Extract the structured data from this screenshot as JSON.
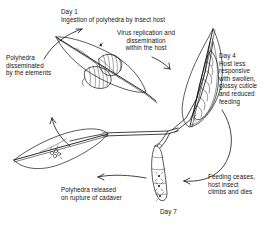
{
  "diagram": {
    "background_color": "#ffffff",
    "line_color": "#141414",
    "captions": {
      "day1": "Day 1\nIngestion of polyhedra by insect host",
      "virus_replication": "Virus replication and\ndissemination\nwithin the host",
      "day4": "Day 4\nHost less\nresponsive\nwith swollen,\nglossy cuticle\nand reduced\nfeeding",
      "dissemination": "Polyhedra\ndisseminated\nby the elements",
      "feeding_ceases": "Feeding ceases,\nhost insect\nclimbs and dies",
      "polyhedra_released": "Polyhedra released\non rupture of cadaver",
      "day7": "Day 7"
    },
    "stages": [
      {
        "label": "Day 1",
        "description": "Ingestion of polyhedra by insect host"
      },
      {
        "label": "Day 4",
        "description": "Host less responsive with swollen, glossy cuticle and reduced feeding"
      },
      {
        "label": "Day 7",
        "description": "Polyhedra released on rupture of cadaver"
      }
    ],
    "elements": {
      "leaf_top_left": "leaf with feeding larva",
      "leaf_right": "vertical leaf with swollen larva",
      "leaf_bottom_left": "leaf with polyhedra cluster",
      "cadaver": "dead larva hanging from stem releasing polyhedra",
      "polyhedra_cluster": "cluster of polyhedra occlusion bodies"
    }
  }
}
